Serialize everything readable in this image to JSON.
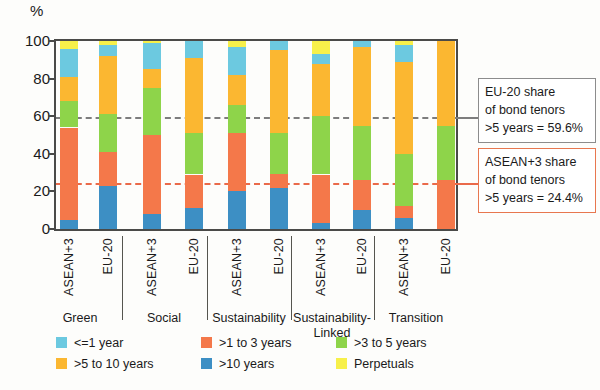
{
  "chart": {
    "type": "bar",
    "y_unit": "%",
    "ytick_labels": [
      "100",
      "80",
      "60",
      "40",
      "20",
      "0"
    ],
    "ytick_values": [
      100,
      80,
      60,
      40,
      20,
      0
    ]
  },
  "annotations": {
    "eu": {
      "line1": "EU-20 share",
      "line2": "of bond tenors",
      "line3": ">5 years = 59.6%",
      "value": 59.6,
      "color": "#7d7d7d"
    },
    "asean": {
      "line1": "ASEAN+3 share",
      "line2": "of bond tenors",
      "line3": ">5 years = 24.4%",
      "value": 24.4,
      "color": "#ea6a4a"
    }
  },
  "legend": {
    "items": [
      {
        "label": "<=1 year",
        "color": "#6cc9e0"
      },
      {
        "label": ">1 to 3 years",
        "color": "#f4784a"
      },
      {
        "label": ">3 to 5 years",
        "color": "#8ed44a"
      },
      {
        "label": ">5 to 10 years",
        "color": "#fbb731"
      },
      {
        "label": ">10 years",
        "color": "#3d8fc4"
      },
      {
        "label": "Perpetuals",
        "color": "#f7f04a"
      }
    ]
  },
  "chart_data": {
    "type": "bar",
    "subtype": "stacked-column",
    "title": "",
    "xlabel": "",
    "ylabel": "%",
    "ylim": [
      0,
      100
    ],
    "grid": false,
    "legend_position": "bottom",
    "series": [
      {
        "name": ">10 years",
        "color": "#3d8fc4",
        "values": [
          5,
          23,
          8,
          11,
          20,
          22,
          3,
          10,
          6,
          0
        ]
      },
      {
        "name": ">1 to 3 years",
        "color": "#f4784a",
        "values": [
          49,
          18,
          42,
          18,
          31,
          7,
          26,
          16,
          6,
          26
        ]
      },
      {
        "name": ">3 to 5 years",
        "color": "#8ed44a",
        "values": [
          14,
          20,
          25,
          22,
          15,
          22,
          31,
          29,
          28,
          29
        ]
      },
      {
        "name": ">5 to 10 years",
        "color": "#fbb731",
        "values": [
          13,
          31,
          10,
          40,
          16,
          44,
          28,
          42,
          49,
          45
        ]
      },
      {
        "name": "<=1 year",
        "color": "#6cc9e0",
        "values": [
          15,
          6,
          14,
          9,
          15,
          5,
          5,
          3,
          9,
          0
        ]
      },
      {
        "name": "Perpetuals",
        "color": "#f7f04a",
        "values": [
          4,
          2,
          1,
          0,
          3,
          0,
          7,
          0,
          2,
          0
        ]
      }
    ],
    "categories": [
      "Green ASEAN+3",
      "Green EU-20",
      "Social ASEAN+3",
      "Social EU-20",
      "Sustainability ASEAN+3",
      "Sustainability EU-20",
      "Sustainability-Linked ASEAN+3",
      "Sustainability-Linked EU-20",
      "Transition ASEAN+3",
      "Transition EU-20"
    ],
    "reference_lines": [
      {
        "label": "EU-20 share of bond tenors >5 years",
        "value": 59.6,
        "color": "#7d7d7d",
        "style": "dashed"
      },
      {
        "label": "ASEAN+3 share of bond tenors >5 years",
        "value": 24.4,
        "color": "#ea6a4a",
        "style": "dashed"
      }
    ]
  },
  "xaxis": {
    "bars": [
      {
        "region": "ASEAN+3"
      },
      {
        "region": "EU-20"
      },
      {
        "region": "ASEAN+3"
      },
      {
        "region": "EU-20"
      },
      {
        "region": "ASEAN+3"
      },
      {
        "region": "EU-20"
      },
      {
        "region": "ASEAN+3"
      },
      {
        "region": "EU-20"
      },
      {
        "region": "ASEAN+3"
      },
      {
        "region": "EU-20"
      }
    ],
    "groups": [
      {
        "label": "Green"
      },
      {
        "label": "Social"
      },
      {
        "label": "Sustainability"
      },
      {
        "label": "Sustainability-"
      },
      {
        "label": "Transition"
      }
    ],
    "group_wrap": "Linked"
  }
}
